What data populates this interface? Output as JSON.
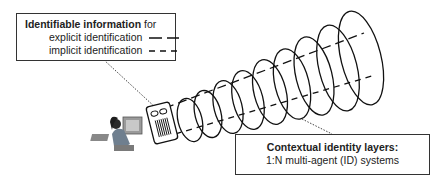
{
  "legend": {
    "title_bold": "Identifiable information",
    "title_rest": " for",
    "items": [
      {
        "label": "explicit identification",
        "line_style": "long-dash"
      },
      {
        "label": "implicit identification",
        "line_style": "short-dash"
      }
    ]
  },
  "layers_box": {
    "title": "Contextual identity layers:",
    "subtitle": "1:N multi-agent (ID) systems"
  },
  "figure": {
    "user_icon": "person-at-computer-icon",
    "device_icon": "id-card-device-icon",
    "layer_count": 9,
    "stroke_color": "#111111"
  }
}
